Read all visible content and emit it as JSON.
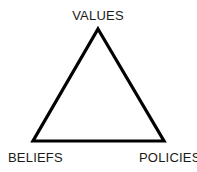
{
  "diagram": {
    "type": "triangle-relationship-diagram",
    "background_color": "#ffffff",
    "stroke_color": "#000000",
    "stroke_width": 3,
    "text_color": "#1a1a1a",
    "vertices": {
      "apex": {
        "label": "VALUES",
        "x": 98,
        "y": 29
      },
      "bottom_left": {
        "label": "BELIEFS",
        "x": 33,
        "y": 141
      },
      "bottom_right": {
        "label": "POLICIES",
        "x": 164,
        "y": 141
      }
    },
    "labels": {
      "top": "VALUES",
      "left": "BELIEFS",
      "right": "POLICIES"
    }
  }
}
